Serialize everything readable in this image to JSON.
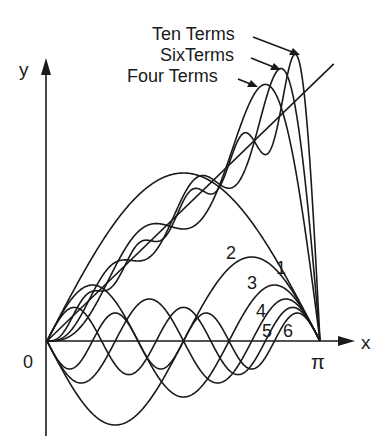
{
  "chart_data": {
    "type": "line",
    "xlabel": "x",
    "ylabel": "y",
    "xlim": [
      0,
      3.14159
    ],
    "ylim": [
      -1.05,
      3.5
    ],
    "grid": false,
    "x_ticks": [
      {
        "value": 0,
        "label": "0"
      },
      {
        "value": 3.14159,
        "label": "π"
      }
    ],
    "function": "y = x",
    "series_formula": "x = 2 Σ (-1)^(n+1) sin(nx) / n",
    "term_series": [
      {
        "name": "1",
        "n": 1,
        "coefficient": 2.0
      },
      {
        "name": "2",
        "n": 2,
        "coefficient": -1.0
      },
      {
        "name": "3",
        "n": 3,
        "coefficient": 0.6667
      },
      {
        "name": "4",
        "n": 4,
        "coefficient": -0.5
      },
      {
        "name": "5",
        "n": 5,
        "coefficient": 0.4
      },
      {
        "name": "6",
        "n": 6,
        "coefficient": -0.3333
      }
    ],
    "partial_sums": [
      {
        "name": "Four Terms",
        "terms": 4
      },
      {
        "name": "SixTerms",
        "terms": 6
      },
      {
        "name": "Ten Terms",
        "terms": 10
      }
    ],
    "annotations": [
      "Ten Terms",
      "SixTerms",
      "Four Terms",
      "1",
      "2",
      "3",
      "4",
      "5",
      "6"
    ]
  },
  "labels": {
    "y_axis": "y",
    "x_axis": "x",
    "origin": "0",
    "pi": "π",
    "ten_terms": "Ten Terms",
    "six_terms": "SixTerms",
    "four_terms": "Four Terms",
    "t1": "1",
    "t2": "2",
    "t3": "3",
    "t4": "4",
    "t5": "5",
    "t6": "6"
  }
}
